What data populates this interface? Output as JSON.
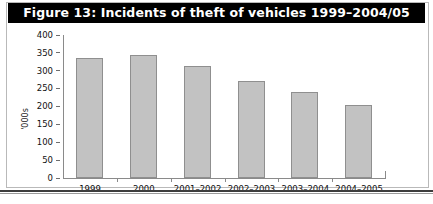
{
  "figure": {
    "title": "Figure 13: Incidents of theft of vehicles 1999–2004/05",
    "title_background": "#000000",
    "title_color": "#ffffff"
  },
  "chart_data": {
    "type": "bar",
    "title": "Figure 13: Incidents of theft of vehicles 1999–2004/05",
    "categories": [
      "1999",
      "2000",
      "2001–2002",
      "2002–2003",
      "2003–2004",
      "2004–2005"
    ],
    "values": [
      337,
      344,
      312,
      272,
      240,
      205
    ],
    "xlabel": "",
    "ylabel": "'000s",
    "ylim": [
      0,
      400
    ],
    "yticks": [
      "0",
      "50",
      "100",
      "150",
      "200",
      "250",
      "300",
      "350",
      "400"
    ],
    "grid": false,
    "legend": false,
    "bar_fill": "#c2c2c2",
    "bar_border": "#8f8f8f"
  }
}
